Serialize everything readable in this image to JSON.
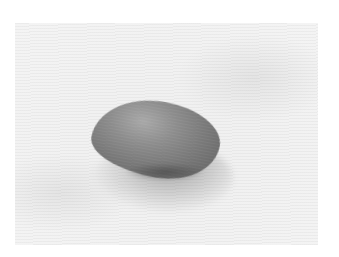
{
  "image": {
    "subject": "smooth stone on textured white cloth",
    "style": "grayscale photograph",
    "colors": {
      "border": "#ffffff",
      "surface": "#f1f1f1",
      "stone_light": "#a8a8a8",
      "stone_dark": "#6a6a6a"
    }
  }
}
